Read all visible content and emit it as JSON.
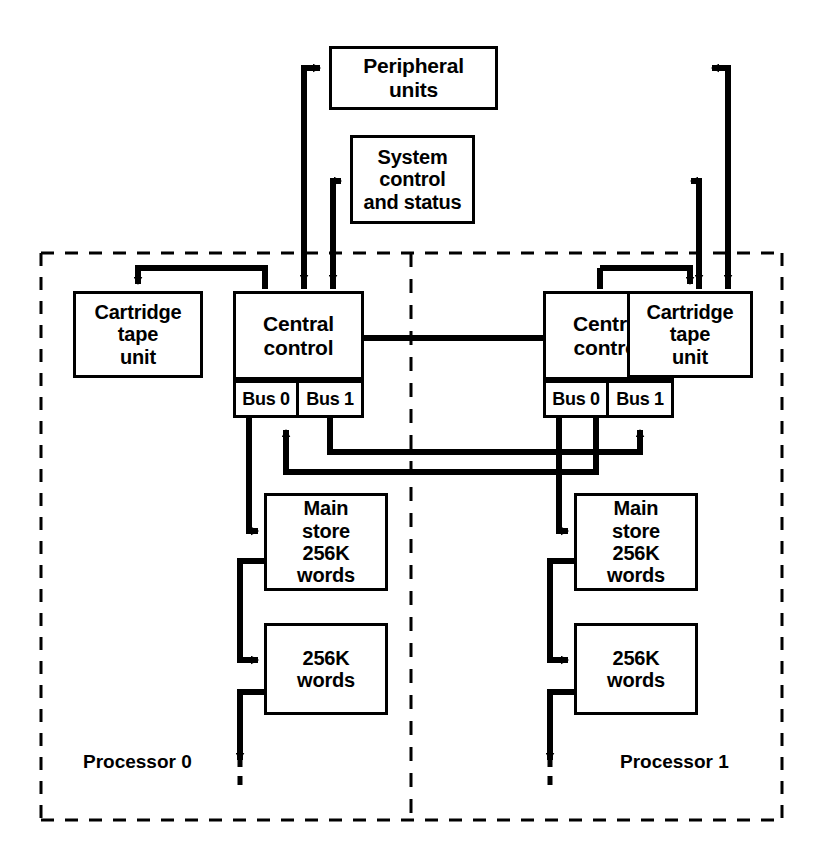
{
  "diagram": {
    "ink": "#000000",
    "paper": "#ffffff"
  },
  "nodes": {
    "peripheral_units": "Peripheral\nunits",
    "system_control": "System\ncontrol\nand status",
    "central_control_0": "Central\ncontrol",
    "central_control_1": "Central\ncontrol",
    "cartridge_tape_0": "Cartridge\ntape\nunit",
    "cartridge_tape_1": "Cartridge\ntape\nunit",
    "main_store_0": "Main\nstore\n256K\nwords",
    "main_store_1": "Main\nstore\n256K\nwords",
    "extra_store_0": "256K\nwords",
    "extra_store_1": "256K\nwords"
  },
  "buses": {
    "p0_bus0": "Bus 0",
    "p0_bus1": "Bus 1",
    "p1_bus0": "Bus 0",
    "p1_bus1": "Bus 1"
  },
  "partitions": {
    "processor_0": "Processor 0",
    "processor_1": "Processor 1"
  }
}
